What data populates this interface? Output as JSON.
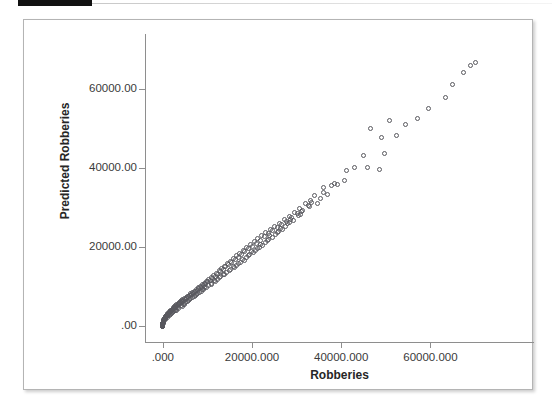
{
  "page": {
    "background_color": "#ffffff",
    "marker_bar_color": "#111111"
  },
  "panel": {
    "border_color": "#b4b4b4",
    "background_color": "#ffffff"
  },
  "chart_data": {
    "type": "scatter",
    "title": "",
    "xlabel": "Robberies",
    "ylabel": "Predicted Robberies",
    "xlim": [
      -4000,
      83000
    ],
    "ylim": [
      -4000,
      74000
    ],
    "xticks": [
      0,
      20000,
      40000,
      60000
    ],
    "yticks": [
      0,
      20000,
      40000,
      60000
    ],
    "xticklabels": [
      ".000",
      "20000.000",
      "40000.000",
      "60000.000"
    ],
    "yticklabels": [
      ".00",
      "20000.00",
      "40000.00",
      "60000.00"
    ],
    "grid": false,
    "legend": null,
    "marker": "open-circle",
    "marker_color": "#58585e",
    "marker_size_px": 5,
    "points": [
      [
        70200,
        66900
      ],
      [
        69000,
        66100
      ],
      [
        67500,
        64300
      ],
      [
        65000,
        61200
      ],
      [
        63300,
        57800
      ],
      [
        59500,
        55200
      ],
      [
        57200,
        52600
      ],
      [
        54500,
        51000
      ],
      [
        52400,
        48200
      ],
      [
        50900,
        52200
      ],
      [
        49800,
        43800
      ],
      [
        49100,
        47800
      ],
      [
        48600,
        39600
      ],
      [
        46600,
        50100
      ],
      [
        45900,
        40200
      ],
      [
        45100,
        43300
      ],
      [
        43000,
        40100
      ],
      [
        41200,
        39400
      ],
      [
        40700,
        36900
      ],
      [
        39200,
        35800
      ],
      [
        37800,
        35600
      ],
      [
        36900,
        33400
      ],
      [
        36100,
        35100
      ],
      [
        35400,
        32400
      ],
      [
        34600,
        31000
      ],
      [
        33900,
        33000
      ],
      [
        33200,
        31800
      ],
      [
        32600,
        30500
      ],
      [
        32000,
        31100
      ],
      [
        31300,
        29400
      ],
      [
        30700,
        29800
      ],
      [
        30100,
        28600
      ],
      [
        29500,
        28900
      ],
      [
        28900,
        27600
      ],
      [
        28400,
        27900
      ],
      [
        27800,
        26500
      ],
      [
        27200,
        26900
      ],
      [
        26700,
        25800
      ],
      [
        26100,
        26100
      ],
      [
        25600,
        25000
      ],
      [
        25100,
        25300
      ],
      [
        24600,
        24200
      ],
      [
        24100,
        24500
      ],
      [
        23600,
        23400
      ],
      [
        23100,
        23700
      ],
      [
        22700,
        22600
      ],
      [
        22200,
        22900
      ],
      [
        21800,
        21800
      ],
      [
        21300,
        22100
      ],
      [
        20900,
        21000
      ],
      [
        20500,
        21400
      ],
      [
        20000,
        20300
      ],
      [
        19600,
        20600
      ],
      [
        19200,
        19600
      ],
      [
        18800,
        19900
      ],
      [
        18400,
        18900
      ],
      [
        18000,
        19200
      ],
      [
        17600,
        18200
      ],
      [
        17300,
        18500
      ],
      [
        16900,
        17500
      ],
      [
        16500,
        17800
      ],
      [
        16200,
        16900
      ],
      [
        15800,
        17100
      ],
      [
        15500,
        16200
      ],
      [
        15100,
        16500
      ],
      [
        14800,
        15600
      ],
      [
        14500,
        15900
      ],
      [
        14100,
        15000
      ],
      [
        13800,
        15200
      ],
      [
        13500,
        14400
      ],
      [
        13200,
        14600
      ],
      [
        12900,
        13800
      ],
      [
        12600,
        14000
      ],
      [
        12300,
        13200
      ],
      [
        12000,
        13400
      ],
      [
        11700,
        12700
      ],
      [
        11400,
        12900
      ],
      [
        11100,
        12200
      ],
      [
        10900,
        12400
      ],
      [
        10600,
        11700
      ],
      [
        10300,
        11900
      ],
      [
        10100,
        11200
      ],
      [
        9800,
        11400
      ],
      [
        9600,
        10700
      ],
      [
        9300,
        10900
      ],
      [
        9100,
        10300
      ],
      [
        8800,
        10500
      ],
      [
        8600,
        9900
      ],
      [
        8400,
        10100
      ],
      [
        8100,
        9500
      ],
      [
        7900,
        9700
      ],
      [
        7700,
        9100
      ],
      [
        7500,
        9300
      ],
      [
        7300,
        8700
      ],
      [
        7100,
        8900
      ],
      [
        6900,
        8400
      ],
      [
        6700,
        8600
      ],
      [
        6500,
        8000
      ],
      [
        6300,
        8200
      ],
      [
        6100,
        7700
      ],
      [
        5900,
        7900
      ],
      [
        5700,
        7400
      ],
      [
        5500,
        7600
      ],
      [
        5400,
        7100
      ],
      [
        5200,
        7300
      ],
      [
        5000,
        6800
      ],
      [
        4900,
        7000
      ],
      [
        4700,
        6500
      ],
      [
        4500,
        6700
      ],
      [
        4400,
        6300
      ],
      [
        4200,
        6400
      ],
      [
        4100,
        6000
      ],
      [
        3900,
        6200
      ],
      [
        3800,
        5800
      ],
      [
        3700,
        5900
      ],
      [
        3500,
        5500
      ],
      [
        3400,
        5700
      ],
      [
        3300,
        5300
      ],
      [
        3100,
        5400
      ],
      [
        3000,
        5000
      ],
      [
        2900,
        5200
      ],
      [
        2800,
        4800
      ],
      [
        2700,
        4900
      ],
      [
        2600,
        4600
      ],
      [
        2500,
        4700
      ],
      [
        2400,
        4400
      ],
      [
        2300,
        4500
      ],
      [
        2200,
        4200
      ],
      [
        2100,
        4300
      ],
      [
        2000,
        4000
      ],
      [
        1900,
        4100
      ],
      [
        1800,
        3800
      ],
      [
        1750,
        3900
      ],
      [
        1650,
        3600
      ],
      [
        1600,
        3700
      ],
      [
        1500,
        3400
      ],
      [
        1450,
        3500
      ],
      [
        1350,
        3200
      ],
      [
        1300,
        3300
      ],
      [
        1250,
        3000
      ],
      [
        1150,
        3100
      ],
      [
        1100,
        2900
      ],
      [
        1050,
        2950
      ],
      [
        950,
        2700
      ],
      [
        900,
        2800
      ],
      [
        850,
        2550
      ],
      [
        800,
        2650
      ],
      [
        750,
        2400
      ],
      [
        700,
        2500
      ],
      [
        650,
        2250
      ],
      [
        600,
        2350
      ],
      [
        580,
        2150
      ],
      [
        540,
        2200
      ],
      [
        500,
        2000
      ],
      [
        470,
        2050
      ],
      [
        440,
        1900
      ],
      [
        410,
        1950
      ],
      [
        380,
        1800
      ],
      [
        350,
        1850
      ],
      [
        330,
        1700
      ],
      [
        300,
        1750
      ],
      [
        280,
        1600
      ],
      [
        260,
        1650
      ],
      [
        240,
        1500
      ],
      [
        220,
        1550
      ],
      [
        200,
        1400
      ],
      [
        180,
        1450
      ],
      [
        165,
        1300
      ],
      [
        150,
        1350
      ],
      [
        135,
        1200
      ],
      [
        120,
        1250
      ],
      [
        110,
        1100
      ],
      [
        100,
        1150
      ],
      [
        90,
        1000
      ],
      [
        80,
        1050
      ],
      [
        70,
        900
      ],
      [
        62,
        950
      ],
      [
        55,
        820
      ],
      [
        48,
        870
      ],
      [
        42,
        740
      ],
      [
        36,
        780
      ],
      [
        31,
        650
      ],
      [
        26,
        700
      ],
      [
        22,
        580
      ],
      [
        18,
        620
      ],
      [
        15,
        500
      ],
      [
        12,
        540
      ],
      [
        10,
        430
      ],
      [
        8,
        460
      ],
      [
        6,
        360
      ],
      [
        5,
        390
      ],
      [
        4,
        300
      ],
      [
        3,
        330
      ],
      [
        2,
        250
      ],
      [
        1,
        270
      ],
      [
        1,
        200
      ],
      [
        0,
        220
      ],
      [
        0,
        160
      ],
      [
        0,
        180
      ],
      [
        0,
        120
      ],
      [
        0,
        140
      ],
      [
        0,
        90
      ],
      [
        0,
        100
      ],
      [
        0,
        60
      ],
      [
        0,
        70
      ],
      [
        0,
        40
      ],
      [
        0,
        50
      ],
      [
        0,
        20
      ],
      [
        0,
        30
      ],
      [
        0,
        10
      ],
      [
        0,
        0
      ],
      [
        0,
        5
      ],
      [
        2600,
        4000
      ],
      [
        3200,
        4800
      ],
      [
        1900,
        3200
      ],
      [
        4800,
        5600
      ],
      [
        6200,
        7000
      ],
      [
        7800,
        8200
      ],
      [
        9400,
        9800
      ],
      [
        11500,
        11500
      ],
      [
        13600,
        13200
      ],
      [
        15900,
        15100
      ],
      [
        17800,
        16800
      ],
      [
        19800,
        18900
      ],
      [
        21900,
        20800
      ],
      [
        24000,
        22900
      ],
      [
        26300,
        24800
      ],
      [
        28700,
        27000
      ],
      [
        31000,
        29100
      ],
      [
        33400,
        31400
      ],
      [
        36000,
        33800
      ],
      [
        38500,
        36200
      ],
      [
        2200,
        3500
      ],
      [
        4100,
        5200
      ],
      [
        5800,
        6600
      ],
      [
        7400,
        7900
      ],
      [
        9000,
        9200
      ],
      [
        10800,
        10600
      ],
      [
        12800,
        12300
      ],
      [
        14900,
        14200
      ],
      [
        17000,
        16000
      ],
      [
        19100,
        17900
      ],
      [
        21200,
        19800
      ],
      [
        23400,
        21700
      ],
      [
        25700,
        23700
      ],
      [
        28000,
        25900
      ],
      [
        30400,
        28000
      ],
      [
        32800,
        30300
      ],
      [
        1400,
        2600
      ],
      [
        3000,
        4100
      ],
      [
        4600,
        5400
      ],
      [
        6000,
        6800
      ],
      [
        7600,
        8000
      ],
      [
        9200,
        9400
      ],
      [
        11000,
        10800
      ],
      [
        13000,
        12500
      ],
      [
        15200,
        14400
      ],
      [
        17400,
        16200
      ],
      [
        19500,
        18100
      ],
      [
        21600,
        20000
      ],
      [
        23800,
        22000
      ],
      [
        26000,
        24000
      ],
      [
        28300,
        26200
      ],
      [
        30800,
        28400
      ],
      [
        1000,
        2100
      ],
      [
        2400,
        3700
      ],
      [
        3600,
        4600
      ],
      [
        5100,
        6000
      ],
      [
        6600,
        7200
      ],
      [
        8200,
        8500
      ],
      [
        9900,
        9900
      ],
      [
        11800,
        11300
      ],
      [
        13800,
        13000
      ],
      [
        16000,
        14900
      ],
      [
        18200,
        16700
      ],
      [
        20300,
        18600
      ],
      [
        22400,
        20500
      ],
      [
        24600,
        22500
      ],
      [
        26900,
        24500
      ],
      [
        29200,
        26700
      ],
      [
        700,
        1700
      ],
      [
        1700,
        2900
      ],
      [
        2900,
        3900
      ],
      [
        4300,
        5000
      ],
      [
        5600,
        6300
      ],
      [
        7000,
        7500
      ],
      [
        8600,
        8800
      ],
      [
        10300,
        10200
      ],
      [
        12200,
        11800
      ],
      [
        14300,
        13600
      ],
      [
        16500,
        15400
      ],
      [
        18700,
        17300
      ],
      [
        20800,
        19200
      ],
      [
        23000,
        21100
      ],
      [
        25200,
        23100
      ],
      [
        27500,
        25200
      ]
    ]
  },
  "axis": {
    "line_color": "#8e8e8e",
    "tick_color": "#8e8e8e",
    "label_color": "#3a3a3a",
    "title_color": "#262626"
  }
}
